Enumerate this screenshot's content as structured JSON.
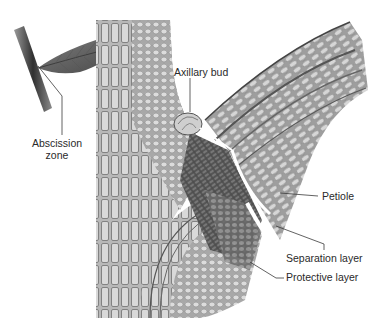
{
  "figure": {
    "style": "grayscale cellular cross-section illustration",
    "labels": {
      "abscission_zone": "Abscission\nzone",
      "abscission_line1": "Abscission",
      "abscission_line2": "zone",
      "axillary_bud": "Axillary bud",
      "petiole": "Petiole",
      "separation_layer": "Separation layer",
      "protective_layer": "Protective layer"
    },
    "colors": {
      "background": "#ffffff",
      "tissue_light": "#c9c9c9",
      "tissue_mid": "#9a9a9a",
      "tissue_dark": "#5a5a5a",
      "leader_line": "#3a3a3a",
      "label_text": "#2a2a2a"
    }
  }
}
